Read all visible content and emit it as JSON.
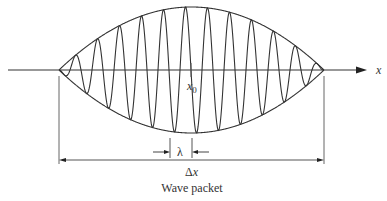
{
  "diagram": {
    "caption": "Wave packet",
    "axis_label": "x",
    "center_label": "x",
    "center_subscript": "0",
    "wavelength_label": "λ",
    "width_label_delta": "Δ",
    "width_label_var": "x",
    "colors": {
      "line": "#333333",
      "background": "#ffffff"
    },
    "geometry": {
      "axis_y": 70,
      "axis_x_start": 8,
      "axis_x_end": 366,
      "packet_left": 59,
      "packet_right": 324,
      "envelope_amplitude": 63,
      "center_x": 191,
      "wavelength_px": 22,
      "wavelength_bracket": [
        170,
        192
      ],
      "width_bracket_y": 160
    }
  }
}
